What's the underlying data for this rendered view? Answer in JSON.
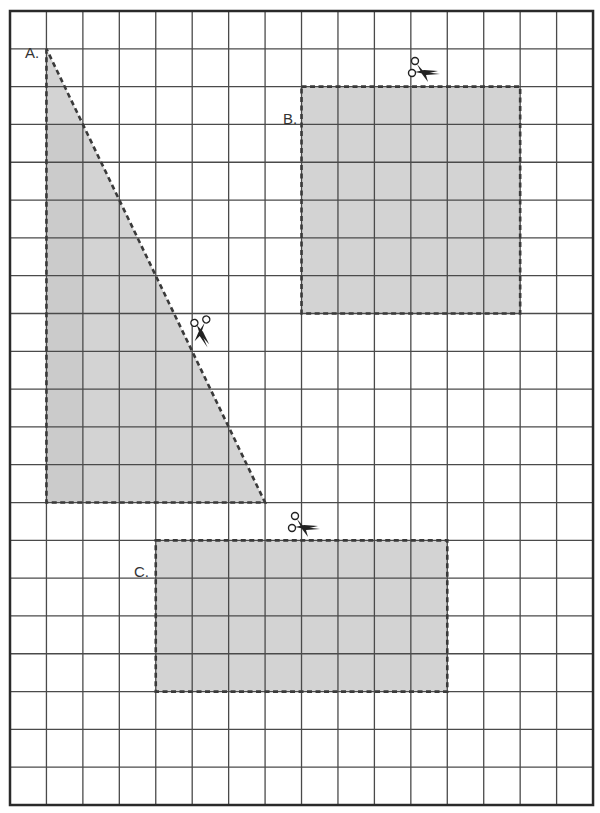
{
  "worksheet": {
    "grid": {
      "left": 10,
      "top": 11,
      "cols": 16,
      "rows": 21,
      "cell_width": 36.44,
      "cell_height": 37.81,
      "line_color": "#4a4a4a",
      "border_color": "#2a2a2a"
    },
    "fill_color": "#d3d3d3",
    "fill_dark_color": "#c6c6c6",
    "cut_line_color": "#3a3a3a",
    "shapes": [
      {
        "id": "A",
        "label": "A.",
        "type": "right-triangle",
        "points": [
          [
            1,
            1
          ],
          [
            1,
            13
          ],
          [
            7,
            13
          ]
        ],
        "base_units": 6,
        "height_units": 12,
        "label_pos": [
          25,
          44
        ]
      },
      {
        "id": "B",
        "label": "B.",
        "type": "rectangle",
        "col": 8,
        "row": 2,
        "width_units": 6,
        "height_units": 6,
        "label_pos": [
          283,
          110
        ]
      },
      {
        "id": "C",
        "label": "C.",
        "type": "rectangle",
        "col": 4,
        "row": 14,
        "width_units": 8,
        "height_units": 4,
        "label_pos": [
          134,
          563
        ]
      }
    ],
    "scissors": [
      {
        "name": "scissors-icon-b",
        "x": 410,
        "y": 58,
        "rotation": 0
      },
      {
        "name": "scissors-icon-a",
        "x": 190,
        "y": 318,
        "rotation": 60
      },
      {
        "name": "scissors-icon-c",
        "x": 290,
        "y": 513,
        "rotation": 0
      }
    ]
  }
}
